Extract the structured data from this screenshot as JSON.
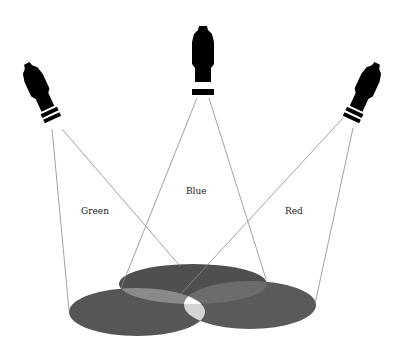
{
  "diagram": {
    "type": "additive-color-spotlights",
    "labels": {
      "green": "Green",
      "blue": "Blue",
      "red": "Red"
    },
    "colors": {
      "background": "#ffffff",
      "spotlight": "#000000",
      "beam_line": "#888888",
      "ellipse_blue": "#4f4f4f",
      "ellipse_green": "#565656",
      "ellipse_red": "#5a5a5a",
      "overlap_two": "#8c8c8c",
      "overlap_three_top": "#ffffff",
      "overlap_three_bottom": "#d4d4d4",
      "text": "#222222"
    },
    "spotlights": [
      {
        "name": "Green",
        "position": "left"
      },
      {
        "name": "Blue",
        "position": "center"
      },
      {
        "name": "Red",
        "position": "right"
      }
    ]
  }
}
